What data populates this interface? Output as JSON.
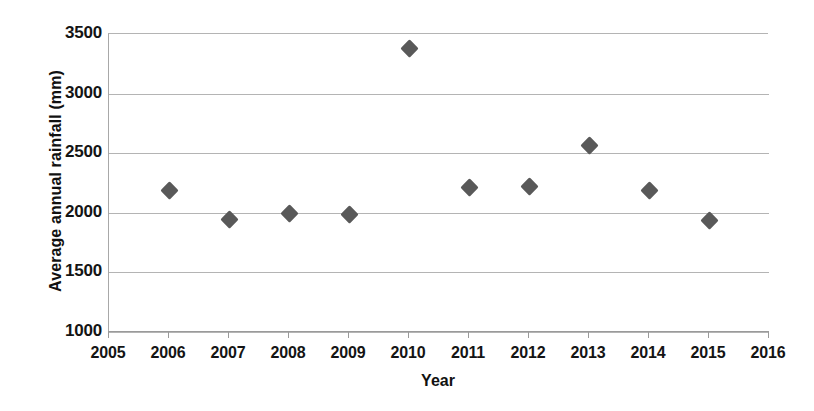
{
  "chart_data": {
    "type": "scatter",
    "title": "",
    "xlabel": "Year",
    "ylabel": "Average annual rainfall (mm)",
    "xlim": [
      2005,
      2016
    ],
    "ylim": [
      1000,
      3500
    ],
    "grid": true,
    "legend": false,
    "marker": {
      "shape": "diamond",
      "color": "#595959",
      "size_px": 13
    },
    "x_ticks": [
      2005,
      2006,
      2007,
      2008,
      2009,
      2010,
      2011,
      2012,
      2013,
      2014,
      2015,
      2016
    ],
    "x_tick_labels": [
      "2005",
      "2006",
      "2007",
      "2008",
      "2009",
      "2010",
      "2011",
      "2012",
      "2013",
      "2014",
      "2015",
      "2016"
    ],
    "y_ticks": [
      1000,
      1500,
      2000,
      2500,
      3000,
      3500
    ],
    "y_tick_labels": [
      "1000",
      "1500",
      "2000",
      "2500",
      "3000",
      "3500"
    ],
    "x": [
      2006,
      2007,
      2008,
      2009,
      2010,
      2011,
      2012,
      2013,
      2014,
      2015
    ],
    "values": [
      2190,
      1945,
      1995,
      1985,
      3375,
      2215,
      2220,
      2565,
      2190,
      1935
    ],
    "points": [
      {
        "year": 2006,
        "rainfall": 2190
      },
      {
        "year": 2007,
        "rainfall": 1945
      },
      {
        "year": 2008,
        "rainfall": 1995
      },
      {
        "year": 2009,
        "rainfall": 1985
      },
      {
        "year": 2010,
        "rainfall": 3375
      },
      {
        "year": 2011,
        "rainfall": 2215
      },
      {
        "year": 2012,
        "rainfall": 2220
      },
      {
        "year": 2013,
        "rainfall": 2565
      },
      {
        "year": 2014,
        "rainfall": 2190
      },
      {
        "year": 2015,
        "rainfall": 1935
      }
    ]
  },
  "colors": {
    "marker": "#595959",
    "gridline": "#b4b4b4",
    "axis": "#9a9a9a",
    "text": "#141414",
    "background": "#ffffff"
  }
}
